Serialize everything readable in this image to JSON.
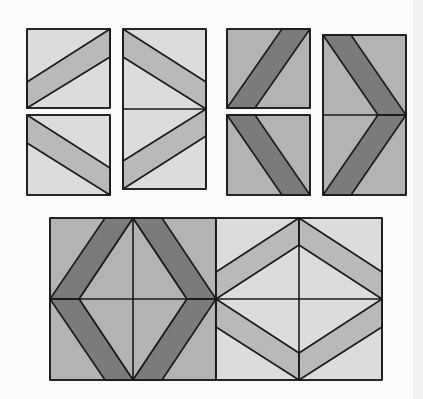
{
  "diagram": {
    "colors": {
      "background": "#fbfbfb",
      "light": "#dcdcdc",
      "light_stripe": "#b9b9b9",
      "medium": "#b3b3b3",
      "dark_stripe": "#7b7b7b",
      "line": "#1a1a1a"
    },
    "top_units": [
      {
        "name": "light-unit-a",
        "x": 27,
        "y": 29,
        "w": 83,
        "h": 79
      },
      {
        "name": "light-unit-b",
        "x": 27,
        "y": 115,
        "w": 83,
        "h": 80
      },
      {
        "name": "light-chevron",
        "x": 123,
        "y": 29,
        "w": 83,
        "h": 160
      },
      {
        "name": "dark-unit-a",
        "x": 227,
        "y": 29,
        "w": 83,
        "h": 79
      },
      {
        "name": "dark-unit-b",
        "x": 227,
        "y": 115,
        "w": 83,
        "h": 80
      },
      {
        "name": "dark-chevron",
        "x": 323,
        "y": 35,
        "w": 83,
        "h": 160
      }
    ],
    "bottom_blocks": [
      {
        "name": "dark-diamond-block",
        "x": 50,
        "y": 218,
        "w": 166,
        "h": 162
      },
      {
        "name": "light-diamond-block",
        "x": 216,
        "y": 218,
        "w": 166,
        "h": 162
      }
    ]
  }
}
